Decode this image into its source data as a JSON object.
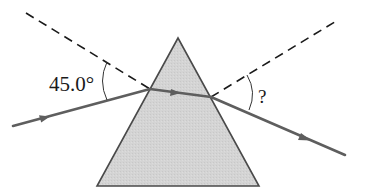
{
  "diagram": {
    "type": "prism-refraction",
    "elements": {
      "prism": {
        "shape": "triangle",
        "fill": "#d3d3d3",
        "stroke": "#444444"
      },
      "incident_ray": {
        "color": "#5a5a5a",
        "direction": "into prism"
      },
      "refracted_ray_inside": {
        "color": "#5a5a5a"
      },
      "emergent_ray": {
        "color": "#5a5a5a",
        "direction": "out of prism"
      },
      "normals": {
        "style": "dashed",
        "color": "#1a1a1a"
      }
    },
    "labels": {
      "incident_angle": "45.0°",
      "emergent_angle": "?"
    }
  }
}
